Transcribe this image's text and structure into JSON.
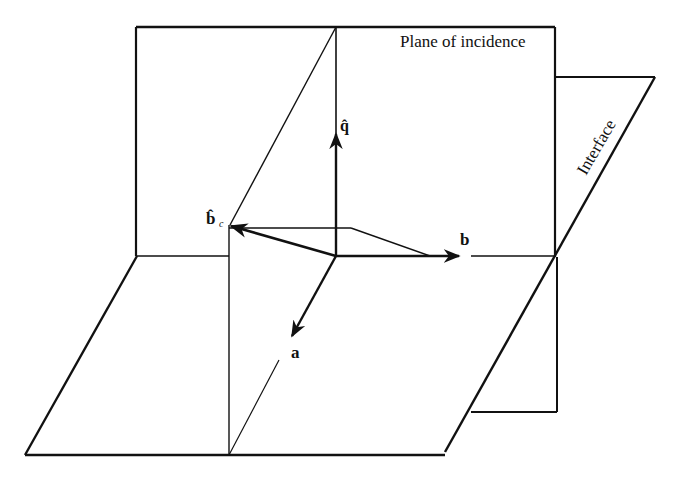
{
  "diagram": {
    "labels": {
      "plane_of_incidence": "Plane of incidence",
      "interface": "Interface",
      "q_hat": "q̂",
      "b_c_hat": "b̂",
      "b_c_sub": "c",
      "b": "b",
      "a": "a"
    },
    "colors": {
      "ink": "#111111",
      "background": "#ffffff"
    }
  }
}
